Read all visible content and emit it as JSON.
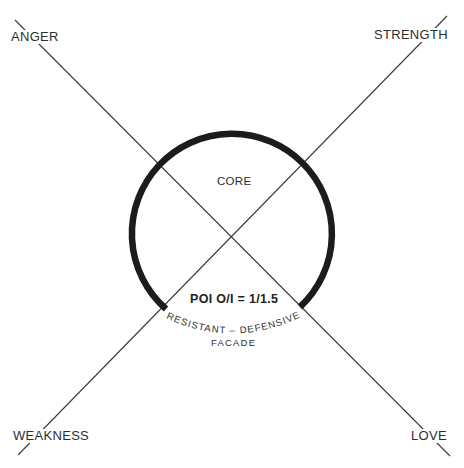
{
  "diagram": {
    "axes": [
      {
        "id": "anger-love",
        "from": "ANGER",
        "to": "LOVE"
      },
      {
        "id": "weakness-strength",
        "from": "WEAKNESS",
        "to": "STRENGTH"
      }
    ],
    "corners": {
      "top_left": "ANGER",
      "top_right": "STRENGTH",
      "bottom_left": "WEAKNESS",
      "bottom_right": "LOVE"
    },
    "circle": {
      "inner_label": "CORE",
      "opening_label": "POI  O/I = 1/1.5",
      "outer_arc_label": "RESISTANT – DEFENSIVE",
      "outer_bottom_label": "FACADE"
    },
    "colors": {
      "line": "#3a3a3a",
      "ring": "#1c1c1c",
      "text": "#2e2e2e"
    }
  }
}
